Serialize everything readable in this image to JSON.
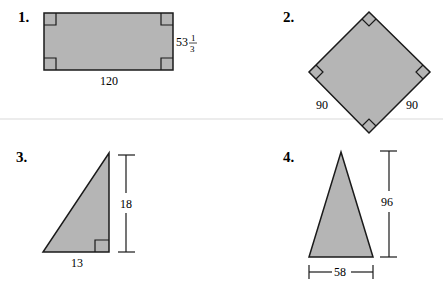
{
  "colors": {
    "shape_fill": "#b5b5b5",
    "stroke": "#1a1a1a",
    "background": "#ffffff",
    "separator": "#e6e6e6"
  },
  "figures": [
    {
      "number": "1.",
      "shape": "rectangle",
      "right_angles": 4,
      "width_label": "120",
      "height_label_whole": "53",
      "height_label_num": "1",
      "height_label_den": "3"
    },
    {
      "number": "2.",
      "shape": "square (rotated 45°)",
      "right_angles": 4,
      "side_left_label": "90",
      "side_right_label": "90"
    },
    {
      "number": "3.",
      "shape": "right triangle",
      "right_angles": 1,
      "base_label": "13",
      "height_label": "18"
    },
    {
      "number": "4.",
      "shape": "triangle",
      "base_label": "58",
      "height_label": "96"
    }
  ]
}
